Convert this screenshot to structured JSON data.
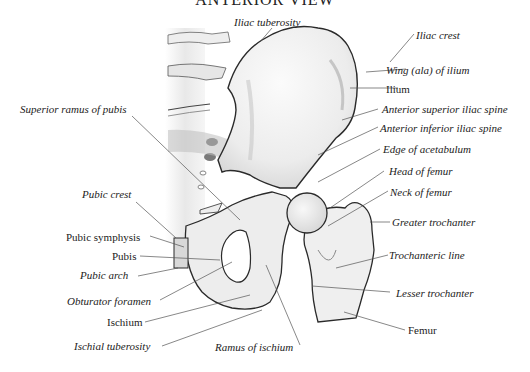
{
  "title": "ANTERIOR VIEW",
  "labels": {
    "iliac_tuberosity": "Iliac tuberosity",
    "iliac_crest": "Iliac crest",
    "wing_of_ilium": "Wing (ala) of ilium",
    "ilium": "Ilium",
    "anterior_superior_iliac_spine": "Anterior superior iliac spine",
    "anterior_inferior_iliac_spine": "Anterior inferior iliac spine",
    "edge_of_acetabulum": "Edge of acetabulum",
    "head_of_femur": "Head of femur",
    "neck_of_femur": "Neck of femur",
    "greater_trochanter": "Greater trochanter",
    "trochanteric_line": "Trochanteric line",
    "lesser_trochanter": "Lesser trochanter",
    "femur": "Femur",
    "superior_ramus_of_pubis": "Superior ramus of pubis",
    "pubic_crest": "Pubic crest",
    "pubic_symphysis": "Pubic symphysis",
    "pubis": "Pubis",
    "pubic_arch": "Pubic arch",
    "obturator_foramen": "Obturator foramen",
    "ischium": "Ischium",
    "ischial_tuberosity": "Ischial tuberosity",
    "ramus_of_ischium": "Ramus of ischium"
  },
  "colors": {
    "bone_fill": "#f1f1f1",
    "bone_outline": "#2a2a2a",
    "leader_line": "#555555",
    "text": "#222222"
  }
}
